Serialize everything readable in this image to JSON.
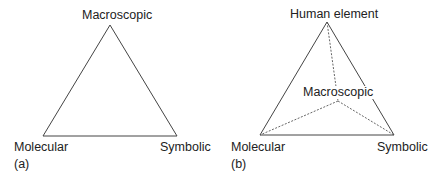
{
  "panels": [
    {
      "id": "a",
      "caption": "(a)",
      "vertices": {
        "top": "Macroscopic",
        "bottom_left": "Molecular",
        "bottom_right": "Symbolic"
      }
    },
    {
      "id": "b",
      "caption": "(b)",
      "vertices": {
        "top": "Human element",
        "center": "Macroscopic",
        "bottom_left": "Molecular",
        "bottom_right": "Symbolic"
      }
    }
  ],
  "colors": {
    "line": "#444444",
    "text": "#222222",
    "background": "#ffffff"
  }
}
